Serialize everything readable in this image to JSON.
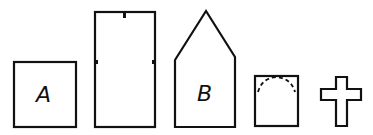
{
  "diagram": {
    "shapes": [
      {
        "id": "square-a",
        "type": "square",
        "label": "A"
      },
      {
        "id": "tall-rectangle",
        "type": "rectangle",
        "label": "",
        "marks": 3
      },
      {
        "id": "pentagon-b",
        "type": "house-pentagon",
        "label": "B"
      },
      {
        "id": "arched-square",
        "type": "square-with-dashed-arc",
        "label": ""
      },
      {
        "id": "cross",
        "type": "cross",
        "label": ""
      }
    ]
  }
}
